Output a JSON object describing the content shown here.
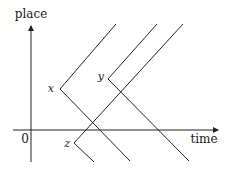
{
  "diagram": {
    "type": "spacetime-diagram",
    "axes": {
      "y_label": "place",
      "x_label": "time",
      "origin_label": "0"
    },
    "points": [
      {
        "label": "x",
        "vertex": [
          60,
          89
        ]
      },
      {
        "label": "y",
        "vertex": [
          108,
          79
        ]
      },
      {
        "label": "z",
        "vertex": [
          74,
          143
        ]
      }
    ],
    "colors": {
      "line": "#222222",
      "text": "#1a1a1a",
      "background": "#ffffff"
    }
  }
}
